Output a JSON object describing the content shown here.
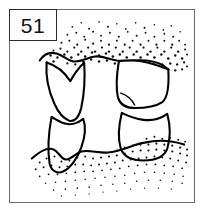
{
  "figure": {
    "label": "51",
    "label_box": {
      "border_color": "#2b2b2b",
      "fill": "#ffffff"
    },
    "frame": {
      "border_color": "#6b6b6b",
      "fill": "#ffffff"
    },
    "caption": "",
    "illustration": {
      "name": "dentition-line-drawing",
      "style": "ink line art with stipple shading",
      "ink_color": "#000000",
      "stipple_color": "#111111",
      "description": "Line drawing of opposing teeth separated by an open interdental space, with stippled gingival tissue above and below",
      "regions": [
        {
          "name": "upper-gingiva-stipple",
          "position": "top",
          "shading": "dense stipple fading upward"
        },
        {
          "name": "upper-left-tooth",
          "position": "upper-left",
          "feature": "notched V-shaped cusp"
        },
        {
          "name": "upper-right-tooth",
          "position": "upper-right",
          "feature": "broad squared crown"
        },
        {
          "name": "lower-left-tooth",
          "position": "lower-left",
          "feature": "tapered crown"
        },
        {
          "name": "lower-right-tooth",
          "position": "lower-right",
          "feature": "broad squared crown"
        },
        {
          "name": "interdental-space",
          "position": "center",
          "shading": "blank white"
        },
        {
          "name": "lower-gingiva-stipple",
          "position": "bottom",
          "shading": "wavy ridge with stipple trailing downward"
        }
      ]
    }
  }
}
